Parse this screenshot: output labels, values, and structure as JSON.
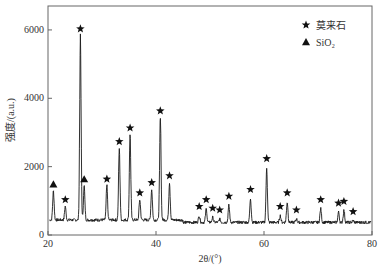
{
  "chart_data": {
    "type": "line",
    "title": "",
    "xlabel": "2θ/(°)",
    "ylabel": "强度/(a.u.)",
    "xlim": [
      20,
      80
    ],
    "ylim": [
      0,
      6700
    ],
    "xticks": [
      20,
      40,
      60,
      80
    ],
    "yticks": [
      0,
      2000,
      4000,
      6000
    ],
    "grid": false,
    "legend_position": "top-right",
    "legend": [
      {
        "marker": "star",
        "label": "莫来石"
      },
      {
        "marker": "triangle",
        "label": "SiO₂"
      }
    ],
    "baseline": 400,
    "peaks": [
      {
        "x": 21.0,
        "y": 1250,
        "phase": "SiO2"
      },
      {
        "x": 23.2,
        "y": 800,
        "phase": "mullite"
      },
      {
        "x": 26.0,
        "y": 5800,
        "phase": "mullite"
      },
      {
        "x": 26.7,
        "y": 1400,
        "phase": "SiO2"
      },
      {
        "x": 30.9,
        "y": 1400,
        "phase": "mullite"
      },
      {
        "x": 33.2,
        "y": 2500,
        "phase": "mullite"
      },
      {
        "x": 35.2,
        "y": 2900,
        "phase": "mullite"
      },
      {
        "x": 37.0,
        "y": 1000,
        "phase": "mullite"
      },
      {
        "x": 39.2,
        "y": 1300,
        "phase": "mullite"
      },
      {
        "x": 40.8,
        "y": 3400,
        "phase": "mullite"
      },
      {
        "x": 42.5,
        "y": 1500,
        "phase": "mullite"
      },
      {
        "x": 48.0,
        "y": 600,
        "phase": "mullite"
      },
      {
        "x": 49.3,
        "y": 800,
        "phase": "mullite"
      },
      {
        "x": 50.5,
        "y": 550,
        "phase": "mullite"
      },
      {
        "x": 51.8,
        "y": 500,
        "phase": "mullite"
      },
      {
        "x": 53.5,
        "y": 900,
        "phase": "mullite"
      },
      {
        "x": 57.5,
        "y": 1100,
        "phase": "mullite"
      },
      {
        "x": 60.5,
        "y": 2000,
        "phase": "mullite"
      },
      {
        "x": 63.0,
        "y": 600,
        "phase": "mullite"
      },
      {
        "x": 64.3,
        "y": 1000,
        "phase": "mullite"
      },
      {
        "x": 66.0,
        "y": 500,
        "phase": "mullite"
      },
      {
        "x": 70.5,
        "y": 800,
        "phase": "mullite"
      },
      {
        "x": 73.8,
        "y": 700,
        "phase": "mullite"
      },
      {
        "x": 74.8,
        "y": 750,
        "phase": "mullite"
      },
      {
        "x": 76.5,
        "y": 450,
        "phase": "mullite"
      }
    ]
  },
  "colors": {
    "line": "#1a1a1a",
    "axis": "#555555",
    "marker": "#111111"
  }
}
